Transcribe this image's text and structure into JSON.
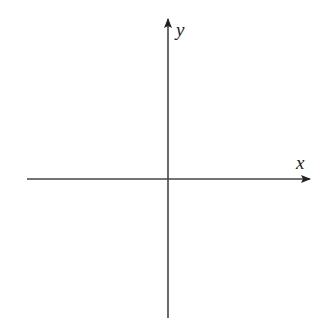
{
  "diagram": {
    "type": "cartesian-axes",
    "x_axis": {
      "label": "x",
      "from": [
        27,
        179
      ],
      "to": [
        310,
        179
      ],
      "arrow": "end"
    },
    "y_axis": {
      "label": "y",
      "from": [
        168,
        318
      ],
      "to": [
        168,
        19
      ],
      "arrow": "end"
    },
    "origin": [
      168,
      179
    ],
    "colors": {
      "axis": "#444444",
      "label": "#222222",
      "background": "#ffffff"
    }
  }
}
